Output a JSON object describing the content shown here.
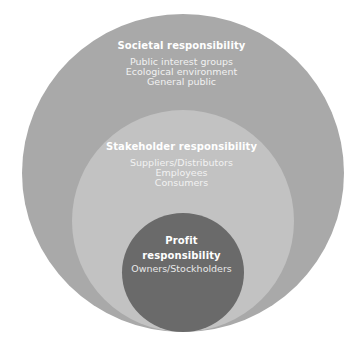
{
  "diagram": {
    "type": "nested-circles",
    "colors": {
      "outer": "#a9a9a9",
      "middle": "#c2c2c2",
      "inner": "#6a6a6a",
      "text": "#ffffff"
    },
    "levels": [
      {
        "title": "Societal responsibility",
        "items": [
          "Public interest groups",
          "Ecological environment",
          "General public"
        ]
      },
      {
        "title": "Stakeholder responsibility",
        "items": [
          "Suppliers/Distributors",
          "Employees",
          "Consumers"
        ]
      },
      {
        "title_lines": [
          "Profit",
          "responsibility"
        ],
        "items": [
          "Owners/Stockholders"
        ]
      }
    ]
  }
}
